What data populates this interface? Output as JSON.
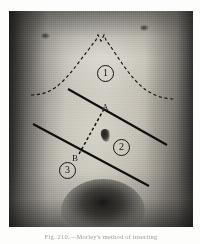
{
  "figure": {
    "caption": "Fig. 210.—Morley's method of inserting",
    "alt_description": "Halftone photograph of a male abdomen marked with surgical landmark lines"
  },
  "plate": {
    "subject": "abdomen-photograph",
    "anatomy": {
      "left_nipple": "nipple",
      "right_nipple": "nipple",
      "umbilicus": "umbilicus",
      "pubic_region": "pubic-hair-region"
    }
  },
  "annotations": {
    "points": [
      {
        "id": "A",
        "label": "A",
        "x": 103,
        "y": 103
      },
      {
        "id": "B",
        "label": "B",
        "x": 73,
        "y": 154
      }
    ],
    "zones": [
      {
        "id": "zone-1",
        "label": "1",
        "x": 97,
        "y": 72
      },
      {
        "id": "zone-2",
        "label": "2",
        "x": 113,
        "y": 146
      },
      {
        "id": "zone-3",
        "label": "3",
        "x": 59,
        "y": 169
      }
    ],
    "lines": [
      {
        "id": "costal-margin",
        "style": "dashed",
        "description": "costal margin outline"
      },
      {
        "id": "upper-oblique-line",
        "style": "solid",
        "description": "upper oblique incision line through point A"
      },
      {
        "id": "lower-oblique-line",
        "style": "solid",
        "description": "lower oblique incision line through point B"
      },
      {
        "id": "ab-connector",
        "style": "dashed",
        "description": "dashed line joining point A to point B"
      }
    ]
  },
  "colors": {
    "ink": "#111111",
    "page_background": "#fdfdfb",
    "plate_midtone": "#c3c0b7"
  }
}
